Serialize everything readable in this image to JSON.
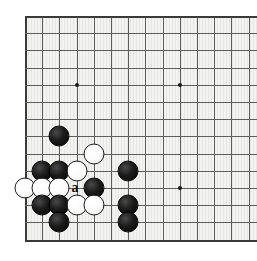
{
  "figure": {
    "kind": "go-board-diagram",
    "board_background_color": "#f3f3f1",
    "grid_line_color": "#5d5d5d",
    "edge_line_color": "#3a3a3a",
    "black_stone_color": "#0a0a0a",
    "white_stone_color": "#fbfbfb",
    "label_color": "#111111"
  },
  "board": {
    "origin_x": 25.5,
    "origin_y": 16,
    "spacing": 17.2,
    "cols": 14,
    "rows": 14,
    "vlines": [
      25.5,
      42.7,
      59.9,
      77.1,
      94.3,
      111.5,
      128.7,
      145.9,
      163.1,
      180.3,
      197.5,
      214.7,
      231.9,
      249.1
    ],
    "hlines": [
      16,
      33.2,
      50.4,
      67.6,
      84.8,
      102,
      119.2,
      136.4,
      153.6,
      170.8,
      188,
      205.2,
      222.4,
      239.6
    ],
    "edges": {
      "left": 25.5,
      "top": 16,
      "bottom": 239.6
    },
    "hoshi": [
      {
        "x": 77.1,
        "y": 84.8
      },
      {
        "x": 180.3,
        "y": 84.8
      },
      {
        "x": 180.3,
        "y": 188
      }
    ]
  },
  "stones": [
    {
      "color": "black",
      "x": 59.9,
      "y": 136.4
    },
    {
      "color": "white",
      "x": 94.3,
      "y": 153.6
    },
    {
      "color": "black",
      "x": 42.7,
      "y": 170.8
    },
    {
      "color": "black",
      "x": 59.9,
      "y": 170.8
    },
    {
      "color": "white",
      "x": 77.1,
      "y": 170.8
    },
    {
      "color": "black",
      "x": 128.7,
      "y": 170.8
    },
    {
      "color": "white",
      "x": 25.5,
      "y": 188
    },
    {
      "color": "white",
      "x": 42.7,
      "y": 188
    },
    {
      "color": "white",
      "x": 59.9,
      "y": 188
    },
    {
      "color": "black",
      "x": 94.3,
      "y": 188
    },
    {
      "color": "black",
      "x": 42.7,
      "y": 205.2
    },
    {
      "color": "black",
      "x": 59.9,
      "y": 205.2
    },
    {
      "color": "white",
      "x": 77.1,
      "y": 205.2
    },
    {
      "color": "white",
      "x": 94.3,
      "y": 205.2
    },
    {
      "color": "black",
      "x": 128.7,
      "y": 205.2
    },
    {
      "color": "black",
      "x": 59.9,
      "y": 222.4
    },
    {
      "color": "black",
      "x": 128.7,
      "y": 222.4
    }
  ],
  "markers": [
    {
      "label": "a",
      "x": 77.1,
      "y": 188
    }
  ]
}
